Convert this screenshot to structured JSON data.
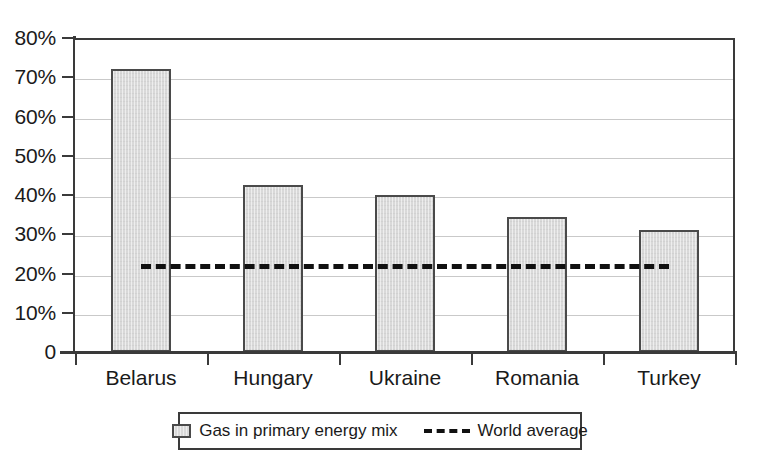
{
  "chart_data": {
    "type": "bar",
    "title": "",
    "xlabel": "",
    "ylabel": "",
    "ylim": [
      0,
      80
    ],
    "ytick_values": [
      0,
      10,
      20,
      30,
      40,
      50,
      60,
      70,
      80
    ],
    "ytick_labels": [
      "0",
      "10%",
      "20%",
      "30%",
      "40%",
      "50%",
      "60%",
      "70%",
      "80%"
    ],
    "grid": true,
    "legend_position": "bottom",
    "categories": [
      "Belarus",
      "Hungary",
      "Ukraine",
      "Romania",
      "Turkey"
    ],
    "series": [
      {
        "name": "Gas in primary energy mix",
        "type": "bar",
        "color": "#d9d9d9",
        "edge_color": "#4a4a4a",
        "values": [
          72,
          42.5,
          40,
          34.5,
          31
        ]
      },
      {
        "name": "World average",
        "type": "line",
        "style": "dashed",
        "color": "#111111",
        "value": 23,
        "values": [
          23,
          23,
          23,
          23,
          23
        ]
      }
    ]
  },
  "axis": {
    "y_labels": [
      "80%",
      "70%",
      "60%",
      "50%",
      "40%",
      "30%",
      "20%",
      "10%",
      "0"
    ],
    "x_labels": [
      "Belarus",
      "Hungary",
      "Ukraine",
      "Romania",
      "Turkey"
    ]
  },
  "legend": {
    "items": [
      {
        "label": "Gas in primary energy mix",
        "marker": "gray-square-swatch"
      },
      {
        "label": "World average",
        "marker": "black-dashed-line"
      }
    ]
  },
  "colors": {
    "background": "#ffffff",
    "bar_fill": "#d9d9d9",
    "bar_edge": "#4a4a4a",
    "axis": "#3a3a3a",
    "gridline": "#c9c9c9",
    "average_line": "#111111",
    "text": "#1a1a1a"
  }
}
